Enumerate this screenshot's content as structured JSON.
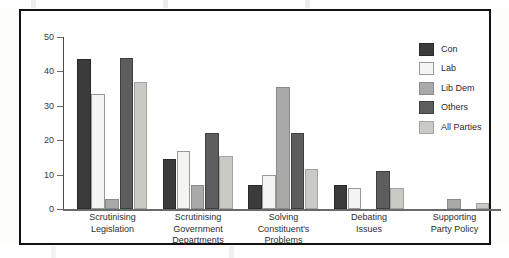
{
  "chart_data": {
    "type": "bar",
    "title": "",
    "subtitle": "",
    "xlabel": "",
    "ylabel": "",
    "ylim": [
      0,
      50
    ],
    "yticks": [
      "0",
      "10",
      "20",
      "30",
      "40",
      "50"
    ],
    "grid": false,
    "legend_position": "top-right",
    "orientation": "vertical",
    "grouping": "grouped",
    "categories": [
      "Scrutinising Legislation",
      "Scrutinising Government Departments",
      "Solving Constituent's Problems",
      "Debating Issues",
      "Supporting Party Policy"
    ],
    "category_lines": [
      [
        "Scrutinising",
        "Legislation"
      ],
      [
        "Scrutinising",
        "Government",
        "Departments"
      ],
      [
        "Solving",
        "Constituent's",
        "Problems"
      ],
      [
        "Debating",
        "Issues"
      ],
      [
        "Supporting",
        "Party Policy"
      ]
    ],
    "series": [
      {
        "name": "Con",
        "color": "#3b3b3b",
        "values": [
          43.5,
          14.5,
          7.0,
          7.0,
          0
        ]
      },
      {
        "name": "Lab",
        "color": "#f4f4f2",
        "values": [
          33.5,
          17.0,
          10.0,
          6.0,
          0
        ]
      },
      {
        "name": "Lib Dem",
        "color": "#a9a9a7",
        "values": [
          3.0,
          7.0,
          35.5,
          0,
          3.0
        ]
      },
      {
        "name": "Others",
        "color": "#5d5d5d",
        "values": [
          44.0,
          22.0,
          22.0,
          11.0,
          0
        ]
      },
      {
        "name": "All Parties",
        "color": "#c9c9c6",
        "values": [
          37.0,
          15.5,
          11.5,
          6.0,
          1.7
        ]
      }
    ]
  },
  "legend": {
    "items": [
      {
        "label": "Con"
      },
      {
        "label": "Lab"
      },
      {
        "label": "Lib Dem"
      },
      {
        "label": "Others"
      },
      {
        "label": "All Parties"
      }
    ]
  }
}
